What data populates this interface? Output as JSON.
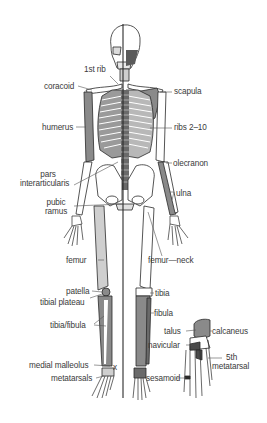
{
  "diagram": {
    "type": "anatomical-skeleton",
    "colors": {
      "outline": "#2a2a2a",
      "bone_fill": "#ffffff",
      "shaded_bone": "#8a8a8a",
      "label_text": "#3a3a3a",
      "leader_line": "#555555",
      "background": "#ffffff"
    },
    "labels": [
      {
        "id": "first-rib",
        "text": "1st rib"
      },
      {
        "id": "coracoid",
        "text": "coracoid"
      },
      {
        "id": "scapula",
        "text": "scapula"
      },
      {
        "id": "humerus",
        "text": "humerus"
      },
      {
        "id": "ribs",
        "text": "ribs 2–10"
      },
      {
        "id": "pars-1",
        "text": "pars"
      },
      {
        "id": "pars-2",
        "text": "interarticularis"
      },
      {
        "id": "olecranon",
        "text": "olecranon"
      },
      {
        "id": "ulna",
        "text": "ulna"
      },
      {
        "id": "pubic-1",
        "text": "pubic"
      },
      {
        "id": "pubic-2",
        "text": "ramus"
      },
      {
        "id": "femur",
        "text": "femur"
      },
      {
        "id": "femur-neck",
        "text": "femur—neck"
      },
      {
        "id": "patella",
        "text": "patella"
      },
      {
        "id": "tibial-plateau",
        "text": "tibial plateau"
      },
      {
        "id": "tibia",
        "text": "tibia"
      },
      {
        "id": "fibula",
        "text": "fibula"
      },
      {
        "id": "tibia-fibula",
        "text": "tibia/fibula"
      },
      {
        "id": "talus",
        "text": "talus"
      },
      {
        "id": "calcaneus",
        "text": "calcaneus"
      },
      {
        "id": "navicular",
        "text": "navicular"
      },
      {
        "id": "fifth-1",
        "text": "5th"
      },
      {
        "id": "fifth-2",
        "text": "metatarsal"
      },
      {
        "id": "medial-malleolus",
        "text": "medial malleolus"
      },
      {
        "id": "metatarsals",
        "text": "metatarsals"
      },
      {
        "id": "sesamoid",
        "text": "sesamoid"
      },
      {
        "id": "x-mark",
        "text": "x"
      }
    ]
  }
}
